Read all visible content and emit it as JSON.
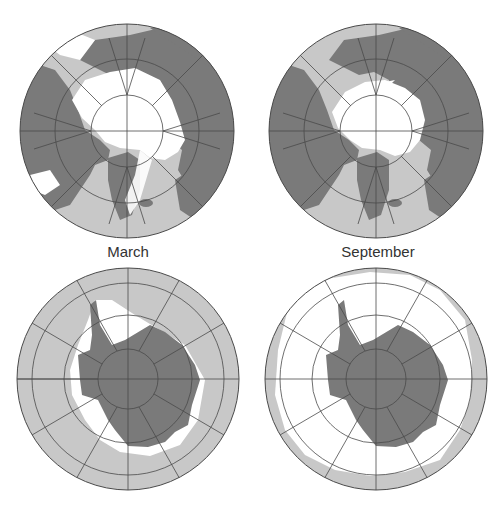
{
  "figure": {
    "panels": [
      {
        "id": "arctic-march",
        "hemisphere": "Northern",
        "month": "March",
        "label": ""
      },
      {
        "id": "arctic-september",
        "hemisphere": "Northern",
        "month": "September",
        "label": ""
      },
      {
        "id": "antarctic-march",
        "hemisphere": "Southern",
        "month": "March",
        "label": ""
      },
      {
        "id": "antarctic-september",
        "hemisphere": "Southern",
        "month": "September",
        "label": ""
      }
    ],
    "labels": {
      "march": "March",
      "september": "September"
    },
    "legend_colors": {
      "land": "#7a7a7a",
      "sea_ice": "#ffffff",
      "open_ocean": "#c8c8c8",
      "grid_lines": "#4a4a4a",
      "coastline": "#2a2a2a"
    }
  }
}
